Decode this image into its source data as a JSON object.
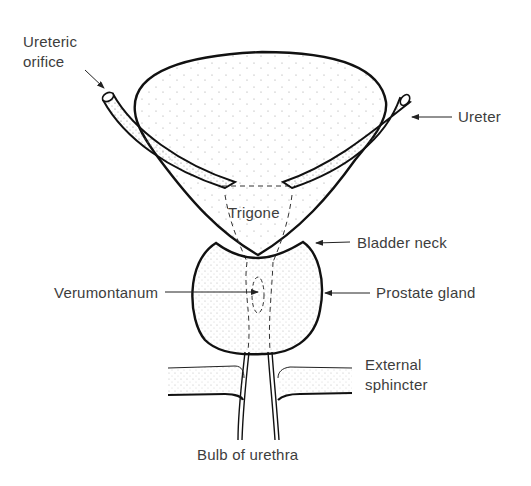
{
  "labels": {
    "ureteric_orifice_line1": "Ureteric",
    "ureteric_orifice_line2": "orifice",
    "ureter": "Ureter",
    "trigone": "Trigone",
    "bladder_neck": "Bladder neck",
    "verumontanum": "Verumontanum",
    "prostate_gland": "Prostate gland",
    "external_sphincter_line1": "External",
    "external_sphincter_line2": "sphincter",
    "bulb_of_urethra": "Bulb of urethra"
  },
  "colors": {
    "line": "#111111",
    "text": "#3d3d3d",
    "stipple": "#9a9a9a",
    "background": "#ffffff"
  }
}
